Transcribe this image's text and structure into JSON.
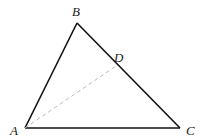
{
  "figure": {
    "type": "triangle",
    "colors": {
      "edge": "#111111",
      "dashed": "#bbbbbb",
      "label": "#222222"
    },
    "points": {
      "A": {
        "label": "A",
        "x": 25,
        "y": 128
      },
      "B": {
        "label": "B",
        "x": 77,
        "y": 23
      },
      "C": {
        "label": "C",
        "x": 180,
        "y": 128
      },
      "D": {
        "label": "D",
        "x": 116,
        "y": 66
      }
    },
    "segments": [
      {
        "from": "A",
        "to": "B",
        "style": "solid"
      },
      {
        "from": "B",
        "to": "C",
        "style": "solid"
      },
      {
        "from": "A",
        "to": "C",
        "style": "solid"
      },
      {
        "from": "A",
        "to": "D",
        "style": "dashed"
      }
    ]
  }
}
